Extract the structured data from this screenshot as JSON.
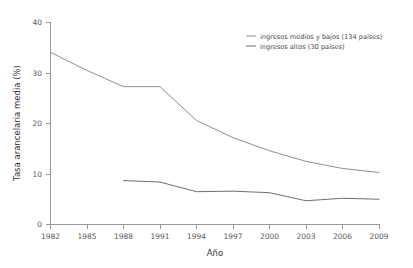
{
  "chart_data": {
    "type": "line",
    "title": "",
    "xlabel": "Año",
    "ylabel": "Tasa arancelaria media (%)",
    "x": [
      1982,
      1985,
      1988,
      1991,
      1994,
      1997,
      2000,
      2003,
      2006,
      2009
    ],
    "xtick_labels": [
      "1982",
      "1985",
      "1988",
      "1991",
      "1994",
      "1997",
      "2000",
      "2003",
      "2006",
      "2009"
    ],
    "ytick_labels": [
      "0",
      "10",
      "20",
      "30",
      "40"
    ],
    "yticks": [
      0,
      10,
      20,
      30,
      40
    ],
    "xlim": [
      1982,
      2009
    ],
    "ylim": [
      0,
      40
    ],
    "grid": false,
    "legend_position": "top-right",
    "series": [
      {
        "name": "ingresos medios y bajos (134 países)",
        "color": "#8f8f8f",
        "x": [
          1982,
          1985,
          1988,
          1991,
          1994,
          1997,
          2000,
          2003,
          2006,
          2009
        ],
        "values": [
          34.1,
          30.5,
          27.3,
          27.3,
          20.6,
          17.2,
          14.6,
          12.5,
          11.1,
          10.3
        ]
      },
      {
        "name": "ingresos altos (30 países)",
        "color": "#6f6f6f",
        "x": [
          1988,
          1991,
          1994,
          1997,
          2000,
          2003,
          2006,
          2009
        ],
        "values": [
          8.7,
          8.4,
          6.5,
          6.6,
          6.3,
          4.7,
          5.2,
          5.0
        ]
      }
    ]
  },
  "axes": {
    "ylabel": "Tasa arancelaria media (%)",
    "xlabel": "Año",
    "ytick_0": "0",
    "ytick_10": "10",
    "ytick_20": "20",
    "ytick_30": "30",
    "ytick_40": "40",
    "xtick_1982": "1982",
    "xtick_1985": "1985",
    "xtick_1988": "1988",
    "xtick_1991": "1991",
    "xtick_1994": "1994",
    "xtick_1997": "1997",
    "xtick_2000": "2000",
    "xtick_2003": "2003",
    "xtick_2006": "2006",
    "xtick_2009": "2009"
  },
  "legend": {
    "entry_a": "ingresos medios y bajos (134 países)",
    "entry_b": "ingresos altos (30 países)"
  }
}
